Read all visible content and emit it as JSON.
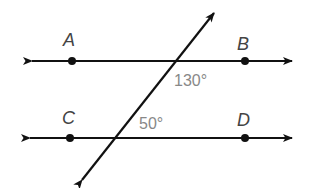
{
  "diagram": {
    "points": [
      {
        "name": "A",
        "x": 72,
        "y": 61
      },
      {
        "name": "B",
        "x": 245,
        "y": 61
      },
      {
        "name": "C",
        "x": 70,
        "y": 138
      },
      {
        "name": "D",
        "x": 245,
        "y": 138
      }
    ],
    "labels": {
      "A": "A",
      "B": "B",
      "C": "C",
      "D": "D"
    },
    "angles": {
      "top": "130°",
      "bottom": "50°"
    },
    "colors": {
      "line": "#111111",
      "label": "#444444",
      "angle_text": "#888888"
    }
  }
}
